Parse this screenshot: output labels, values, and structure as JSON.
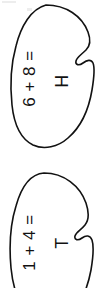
{
  "page": {
    "background_color": "#ffffff",
    "ink_color": "#121212",
    "orientation": "rotated-90-ccw"
  },
  "problems": [
    {
      "id": "problem-top",
      "shape": "blob-outline",
      "operand_a": "6",
      "operator": "+",
      "operand_b": "8",
      "equals": "=",
      "expression": "6 + 8 =",
      "answer_letter": "H",
      "stroke_color": "#121212"
    },
    {
      "id": "problem-bottom",
      "shape": "blob-outline",
      "operand_a": "1",
      "operator": "+",
      "operand_b": "4",
      "equals": "=",
      "expression": "1 + 4 =",
      "answer_letter": "T",
      "stroke_color": "#121212"
    }
  ]
}
